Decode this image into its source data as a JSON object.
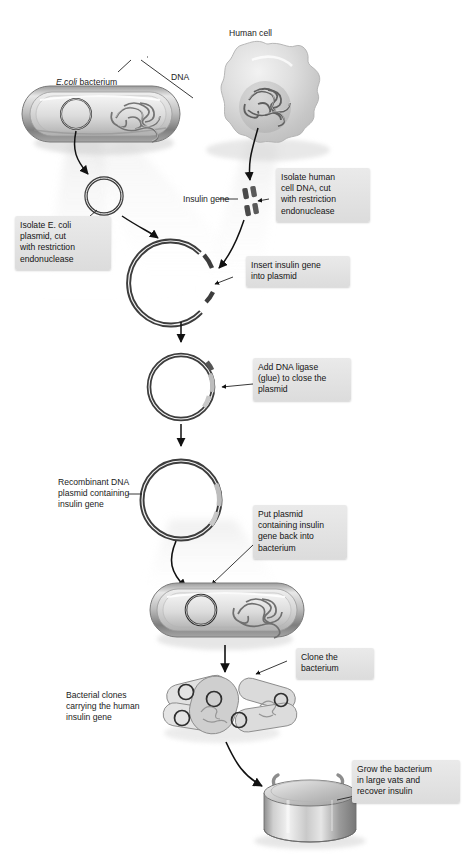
{
  "figure": {
    "type": "process-flow-diagram"
  },
  "labels": {
    "ecoli_bacterium": "E.coli bacterium",
    "ecoli_italic": "E.coli",
    "ecoli_rest": " bacterium",
    "dna": "DNA",
    "human_cell": "Human cell",
    "insulin_gene": "Insulin gene",
    "recombinant_plasmid": "Recombinant DNA\nplasmid containing\ninsulin gene",
    "bacterial_clones": "Bacterial clones\ncarrying the human\ninsulin gene"
  },
  "callouts": [
    {
      "id": "isolate-plasmid",
      "text": "Isolate E. coli\nplasmid, cut\nwith restriction\nendonuclease",
      "step": 1
    },
    {
      "id": "isolate-human-dna",
      "text": "Isolate human\ncell DNA, cut\nwith restriction\nendonuclease",
      "step": 2
    },
    {
      "id": "insert-insulin-gene",
      "text": "Insert insulin gene\ninto plasmid",
      "step": 3
    },
    {
      "id": "add-dna-ligase",
      "text": "Add DNA ligase\n(glue) to close the\nplasmid",
      "step": 4
    },
    {
      "id": "put-plasmid-back",
      "text": "Put plasmid\ncontaining insulin\ngene back into\nbacterium",
      "step": 5
    },
    {
      "id": "clone-bacterium",
      "text": "Clone the\nbacterium",
      "step": 6
    },
    {
      "id": "grow-in-vats",
      "text": "Grow the bacterium\nin large vats and\nrecover insulin",
      "step": 7
    }
  ],
  "icons": {
    "bacterium_top": "ecoli-bacterium-icon",
    "human_cell": "human-cell-icon",
    "plasmid_cut": "cut-plasmid-ring-icon",
    "plasmid_isolated": "isolated-plasmid-ring-icon",
    "insulin_gene_fragment": "insulin-gene-fragment-icon",
    "plasmid_ligated": "ligated-plasmid-ring-icon",
    "plasmid_recombinant": "recombinant-plasmid-ring-icon",
    "bacterium_transformed": "transformed-bacterium-icon",
    "clone_cluster": "bacterial-clone-cluster-icon",
    "fermentation_vat": "fermentation-vat-icon",
    "arrow": "flow-arrow-icon"
  },
  "colors": {
    "callout_bg": "#e3e3e3",
    "text": "#141414",
    "dna_dark": "#3a3a3a",
    "insert_light": "#b9b9b9",
    "cell_fill": "#d7d7d7",
    "arrow": "#111111"
  }
}
